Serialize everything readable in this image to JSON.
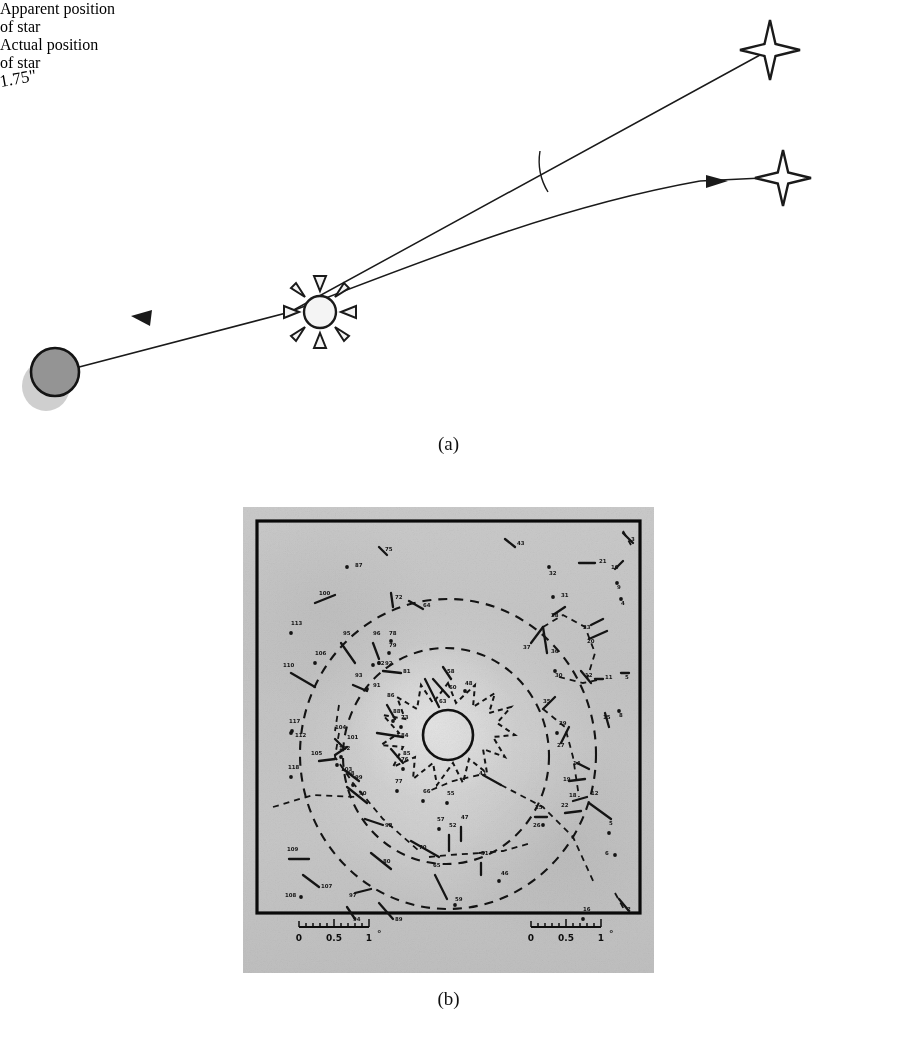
{
  "figure": {
    "panels": [
      {
        "id": "a",
        "caption": "(a)",
        "title": "Gravitational deflection of starlight by the Sun"
      },
      {
        "id": "b",
        "caption": "(b)",
        "title": "Eclipse plate star field with deflection vectors"
      }
    ]
  },
  "panel_a": {
    "caption": "(a)",
    "labels": {
      "apparent": "Apparent position\nof star",
      "apparent_line1": "Apparent position",
      "apparent_line2": "of star",
      "actual": "Actual position\nof star",
      "actual_line1": "Actual position",
      "actual_line2": "of star",
      "angle": "1.75\""
    },
    "objects": {
      "sun": "sun-symbol",
      "earth": "earth-disk",
      "apparent_star": "four-point-star",
      "actual_star": "four-point-star"
    },
    "colors": {
      "line": "#1a1a1a",
      "earth_fill": "#8f8f8f",
      "earth_shadow": "#cccccc",
      "sun_fill": "#f2f2f2"
    }
  },
  "panel_b": {
    "caption": "(b)",
    "scale_bars": [
      {
        "position": "left",
        "ticks": [
          "0",
          "0.5",
          "1"
        ],
        "unit": "°",
        "label": "0  0.5  1°"
      },
      {
        "position": "right",
        "ticks": [
          "0",
          "0.5",
          "1"
        ],
        "unit": "°",
        "label": "0  0.5  1°"
      }
    ],
    "center_disk": "eclipsed-sun-disk",
    "corona_outline": "dashed-corona-contour",
    "contours": [
      "inner-dashed-circle",
      "outer-dashed-circle"
    ],
    "colors": {
      "plate": "#c5c5c5",
      "ink": "#111111",
      "border": "#0a0a0a"
    },
    "star_numbers": [
      2,
      3,
      4,
      5,
      6,
      8,
      9,
      10,
      11,
      12,
      14,
      16,
      18,
      19,
      20,
      21,
      22,
      23,
      25,
      26,
      27,
      28,
      29,
      30,
      31,
      32,
      35,
      36,
      37,
      41,
      43,
      46,
      47,
      48,
      51,
      52,
      55,
      57,
      59,
      60,
      62,
      63,
      64,
      65,
      66,
      70,
      72,
      73,
      75,
      76,
      77,
      79,
      80,
      81,
      84,
      85,
      86,
      87,
      88,
      89,
      90,
      91,
      92,
      93,
      94,
      95,
      96,
      97,
      98,
      99,
      100,
      101,
      102,
      103,
      104,
      105,
      106,
      107,
      108,
      109,
      110,
      112,
      113,
      117,
      118
    ],
    "stars": [
      {
        "n": "113",
        "x": 48,
        "y": 118,
        "dot": [
          48,
          126
        ]
      },
      {
        "n": "117",
        "x": 46,
        "y": 216,
        "dot": [
          49,
          224
        ]
      },
      {
        "n": "112",
        "x": 52,
        "y": 230,
        "dot": [
          48,
          226
        ]
      },
      {
        "n": "118",
        "x": 45,
        "y": 262,
        "dot": [
          48,
          270
        ]
      },
      {
        "n": "110",
        "x": 40,
        "y": 160,
        "seg": [
          48,
          166,
          72,
          180
        ]
      },
      {
        "n": "109",
        "x": 44,
        "y": 344,
        "seg": [
          46,
          352,
          66,
          352
        ]
      },
      {
        "n": "108",
        "x": 42,
        "y": 390,
        "dot": [
          58,
          390
        ]
      },
      {
        "n": "107",
        "x": 78,
        "y": 381,
        "seg": [
          60,
          368,
          76,
          380
        ]
      },
      {
        "n": "97",
        "x": 106,
        "y": 390,
        "seg": [
          112,
          386,
          128,
          382
        ]
      },
      {
        "n": "94",
        "x": 110,
        "y": 414,
        "seg": [
          104,
          400,
          112,
          412
        ]
      },
      {
        "n": "89",
        "x": 152,
        "y": 414,
        "seg": [
          136,
          396,
          150,
          412
        ]
      },
      {
        "n": "106",
        "x": 72,
        "y": 148,
        "dot": [
          72,
          156
        ]
      },
      {
        "n": "105",
        "x": 68,
        "y": 248,
        "seg": [
          76,
          254,
          92,
          252
        ]
      },
      {
        "n": "104",
        "x": 92,
        "y": 222,
        "seg": [
          92,
          232,
          100,
          240
        ]
      },
      {
        "n": "101",
        "x": 104,
        "y": 232,
        "seg": [
          92,
          248,
          104,
          240
        ]
      },
      {
        "n": "102",
        "x": 96,
        "y": 243,
        "dot": [
          98,
          250
        ]
      },
      {
        "n": "103",
        "x": 98,
        "y": 264,
        "dot": [
          94,
          258
        ]
      },
      {
        "n": "100",
        "x": 76,
        "y": 88,
        "seg": [
          72,
          96,
          92,
          88
        ]
      },
      {
        "n": "95",
        "x": 100,
        "y": 128,
        "seg": [
          98,
          136,
          112,
          156
        ]
      },
      {
        "n": "96",
        "x": 130,
        "y": 128,
        "seg": [
          130,
          136,
          136,
          152
        ]
      },
      {
        "n": "93",
        "x": 112,
        "y": 170,
        "seg": [
          110,
          178,
          124,
          184
        ]
      },
      {
        "n": "91",
        "x": 130,
        "y": 180,
        "dot": [
          124,
          182
        ]
      },
      {
        "n": "92",
        "x": 142,
        "y": 158,
        "dot": [
          136,
          156
        ]
      },
      {
        "n": "90",
        "x": 116,
        "y": 288,
        "seg": [
          104,
          280,
          124,
          296
        ]
      },
      {
        "n": "99",
        "x": 112,
        "y": 272,
        "dot": [
          110,
          278
        ]
      },
      {
        "n": "98",
        "x": 104,
        "y": 268,
        "seg": [
          100,
          262,
          116,
          274
        ]
      },
      {
        "n": "92b",
        "x": 142,
        "y": 320,
        "seg": [
          122,
          312,
          140,
          318
        ]
      },
      {
        "n": "80",
        "x": 140,
        "y": 356,
        "seg": [
          128,
          346,
          148,
          362
        ]
      },
      {
        "n": "86",
        "x": 144,
        "y": 190,
        "seg": [
          144,
          198,
          152,
          212
        ]
      },
      {
        "n": "88",
        "x": 150,
        "y": 206,
        "dot": [
          150,
          214
        ]
      },
      {
        "n": "84",
        "x": 158,
        "y": 230,
        "seg": [
          134,
          226,
          160,
          230
        ]
      },
      {
        "n": "85",
        "x": 160,
        "y": 248,
        "seg": [
          148,
          242,
          160,
          256
        ]
      },
      {
        "n": "81",
        "x": 160,
        "y": 166,
        "seg": [
          140,
          164,
          158,
          166
        ]
      },
      {
        "n": "79",
        "x": 146,
        "y": 140,
        "dot": [
          146,
          146
        ]
      },
      {
        "n": "78",
        "x": 146,
        "y": 128,
        "dot": [
          148,
          134
        ]
      },
      {
        "n": "73",
        "x": 158,
        "y": 212,
        "dot": [
          158,
          220
        ]
      },
      {
        "n": "76",
        "x": 158,
        "y": 254,
        "dot": [
          160,
          262
        ]
      },
      {
        "n": "77",
        "x": 152,
        "y": 276,
        "dot": [
          154,
          284
        ]
      },
      {
        "n": "66",
        "x": 180,
        "y": 286,
        "dot": [
          180,
          294
        ]
      },
      {
        "n": "55",
        "x": 204,
        "y": 288,
        "dot": [
          204,
          296
        ]
      },
      {
        "n": "57",
        "x": 194,
        "y": 314,
        "dot": [
          196,
          322
        ]
      },
      {
        "n": "52",
        "x": 206,
        "y": 320,
        "seg": [
          206,
          328,
          206,
          344
        ]
      },
      {
        "n": "47",
        "x": 218,
        "y": 312,
        "seg": [
          218,
          320,
          218,
          334
        ]
      },
      {
        "n": "70",
        "x": 176,
        "y": 342,
        "seg": [
          168,
          334,
          196,
          350
        ]
      },
      {
        "n": "65",
        "x": 190,
        "y": 360,
        "seg": [
          192,
          368,
          204,
          392
        ]
      },
      {
        "n": "51",
        "x": 238,
        "y": 348,
        "seg": [
          238,
          356,
          238,
          368
        ]
      },
      {
        "n": "46",
        "x": 258,
        "y": 368,
        "dot": [
          256,
          374
        ]
      },
      {
        "n": "59",
        "x": 212,
        "y": 394,
        "dot": [
          212,
          398
        ]
      },
      {
        "n": "60",
        "x": 206,
        "y": 182,
        "seg": [
          190,
          172,
          206,
          190
        ]
      },
      {
        "n": "63",
        "x": 196,
        "y": 196,
        "seg": [
          182,
          172,
          196,
          200
        ]
      },
      {
        "n": "58",
        "x": 204,
        "y": 166,
        "seg": [
          200,
          160,
          208,
          172
        ]
      },
      {
        "n": "48",
        "x": 222,
        "y": 178,
        "dot": [
          222,
          184
        ]
      },
      {
        "n": "41",
        "x": 236,
        "y": 268,
        "seg": [
          240,
          268,
          258,
          278
        ]
      },
      {
        "n": "64",
        "x": 180,
        "y": 100,
        "seg": [
          166,
          94,
          180,
          102
        ]
      },
      {
        "n": "72",
        "x": 152,
        "y": 92,
        "seg": [
          148,
          86,
          150,
          100
        ]
      },
      {
        "n": "75",
        "x": 142,
        "y": 44,
        "seg": [
          136,
          40,
          144,
          48
        ]
      },
      {
        "n": "87",
        "x": 112,
        "y": 60,
        "dot": [
          104,
          60
        ]
      },
      {
        "n": "43",
        "x": 274,
        "y": 38,
        "seg": [
          262,
          32,
          272,
          40
        ]
      },
      {
        "n": "32",
        "x": 306,
        "y": 68,
        "dot": [
          306,
          60
        ]
      },
      {
        "n": "31",
        "x": 318,
        "y": 90,
        "dot": [
          310,
          90
        ]
      },
      {
        "n": "28",
        "x": 308,
        "y": 110,
        "seg": [
          310,
          108,
          322,
          100
        ]
      },
      {
        "n": "37",
        "x": 280,
        "y": 142,
        "seg": [
          288,
          136,
          300,
          120
        ]
      },
      {
        "n": "36",
        "x": 308,
        "y": 146,
        "seg": [
          300,
          120,
          304,
          146
        ]
      },
      {
        "n": "30",
        "x": 312,
        "y": 170,
        "dot": [
          312,
          164
        ]
      },
      {
        "n": "35",
        "x": 300,
        "y": 196,
        "seg": [
          300,
          202,
          312,
          190
        ]
      },
      {
        "n": "29",
        "x": 316,
        "y": 218,
        "dot": [
          314,
          226
        ]
      },
      {
        "n": "27",
        "x": 314,
        "y": 240,
        "seg": [
          318,
          236,
          326,
          220
        ]
      },
      {
        "n": "23",
        "x": 340,
        "y": 122,
        "seg": [
          348,
          118,
          360,
          112
        ]
      },
      {
        "n": "20",
        "x": 344,
        "y": 136,
        "seg": [
          346,
          132,
          364,
          124
        ]
      },
      {
        "n": "21",
        "x": 356,
        "y": 56,
        "seg": [
          336,
          56,
          352,
          56
        ]
      },
      {
        "n": "10",
        "x": 368,
        "y": 62,
        "seg": [
          372,
          62,
          380,
          54
        ]
      },
      {
        "n": "9",
        "x": 374,
        "y": 82,
        "dot": [
          374,
          76
        ]
      },
      {
        "n": "4",
        "x": 378,
        "y": 98,
        "dot": [
          378,
          92
        ]
      },
      {
        "n": "3",
        "x": 388,
        "y": 34,
        "seg": [
          380,
          26,
          390,
          36
        ]
      },
      {
        "n": "12b",
        "x": 342,
        "y": 170,
        "seg": [
          338,
          164,
          348,
          176
        ]
      },
      {
        "n": "11",
        "x": 362,
        "y": 172,
        "seg": [
          352,
          172,
          360,
          172
        ]
      },
      {
        "n": "5",
        "x": 382,
        "y": 172,
        "seg": [
          378,
          166,
          386,
          166
        ]
      },
      {
        "n": "8",
        "x": 376,
        "y": 210,
        "dot": [
          376,
          204
        ]
      },
      {
        "n": "14",
        "x": 330,
        "y": 258,
        "seg": [
          334,
          256,
          346,
          262
        ]
      },
      {
        "n": "19",
        "x": 320,
        "y": 274,
        "seg": [
          326,
          274,
          342,
          272
        ]
      },
      {
        "n": "18",
        "x": 326,
        "y": 290,
        "seg": [
          330,
          294,
          344,
          290
        ]
      },
      {
        "n": "12",
        "x": 348,
        "y": 288,
        "seg": [
          346,
          296,
          368,
          312
        ]
      },
      {
        "n": "22",
        "x": 318,
        "y": 300,
        "seg": [
          322,
          306,
          338,
          304
        ]
      },
      {
        "n": "25",
        "x": 292,
        "y": 302,
        "seg": [
          292,
          310,
          304,
          310
        ]
      },
      {
        "n": "26",
        "x": 290,
        "y": 320,
        "dot": [
          300,
          318
        ]
      },
      {
        "n": "5b",
        "x": 366,
        "y": 318,
        "dot": [
          366,
          326
        ]
      },
      {
        "n": "6",
        "x": 362,
        "y": 348,
        "dot": [
          372,
          348
        ]
      },
      {
        "n": "16",
        "x": 340,
        "y": 404,
        "dot": [
          340,
          412
        ]
      },
      {
        "n": "2",
        "x": 384,
        "y": 404,
        "seg": [
          376,
          392,
          386,
          404
        ]
      },
      {
        "n": "62",
        "x": 134,
        "y": 158,
        "dot": [
          130,
          158
        ]
      },
      {
        "n": "15",
        "x": 360,
        "y": 212,
        "seg": [
          362,
          206,
          366,
          220
        ]
      }
    ]
  }
}
